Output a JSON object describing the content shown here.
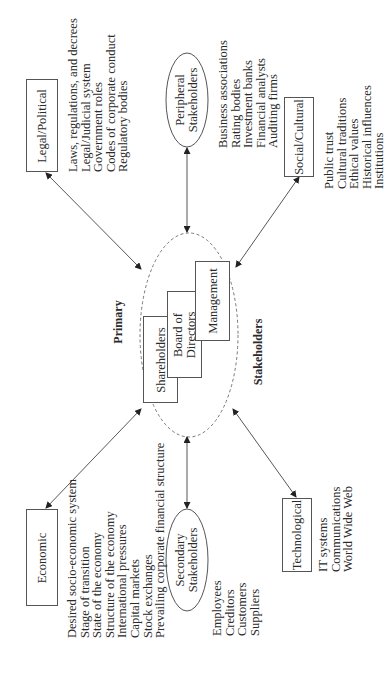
{
  "diagram": {
    "orientation": "rotated 90 degrees counter-clockwise",
    "center": {
      "top_label": "Primary",
      "bottom_label": "Stakeholders",
      "boxes": [
        {
          "label": "Shareholders"
        },
        {
          "label": "Board of Directors",
          "line1": "Board of",
          "line2": "Directors"
        },
        {
          "label": "Management"
        }
      ]
    },
    "nodes": {
      "legal": {
        "label": "Legal/Political",
        "items": [
          "Laws, regulations, and decrees",
          "Legal/Judicial system",
          "Government roles",
          "Codes of corporate conduct",
          "Regulatory bodies"
        ]
      },
      "peripheral": {
        "label": "Peripheral Stakeholders",
        "line1": "Peripheral",
        "line2": "Stakeholders",
        "items": [
          "Business associations",
          "Rating bodies",
          "Investment banks",
          "Financial analysts",
          "Auditing firms"
        ]
      },
      "social": {
        "label": "Social/Cultural",
        "items": [
          "Public trust",
          "Cultural traditions",
          "Ethical values",
          "Historical influences",
          "Institutions"
        ]
      },
      "economic": {
        "label": "Economic",
        "items": [
          "Desired socio-economic system",
          "Stage of transition",
          "State of the economy",
          "Structure of the economy",
          "International pressures",
          "Capital markets",
          "Stock exchanges",
          "Prevailing corporate financial structure"
        ]
      },
      "secondary": {
        "label": "Secondary Stakeholders",
        "line1": "Secondary",
        "line2": "Stakeholders",
        "items": [
          "Employees",
          "Creditors",
          "Customers",
          "Suppliers"
        ]
      },
      "technological": {
        "label": "Technological",
        "items": [
          "IT systems",
          "Communications",
          "World Wide Web"
        ]
      }
    },
    "connectors": [
      {
        "from": "Legal/Political",
        "to": "Primary Stakeholders",
        "type": "double-arrow"
      },
      {
        "from": "Peripheral Stakeholders",
        "to": "Primary Stakeholders",
        "type": "double-arrow"
      },
      {
        "from": "Social/Cultural",
        "to": "Primary Stakeholders",
        "type": "double-arrow"
      },
      {
        "from": "Economic",
        "to": "Primary Stakeholders",
        "type": "double-arrow"
      },
      {
        "from": "Secondary Stakeholders",
        "to": "Primary Stakeholders",
        "type": "double-arrow"
      },
      {
        "from": "Technological",
        "to": "Primary Stakeholders",
        "type": "double-arrow"
      }
    ],
    "colors": {
      "line": "#444444",
      "dashed_ellipse": "#777777",
      "text": "#2a2a2a"
    }
  }
}
